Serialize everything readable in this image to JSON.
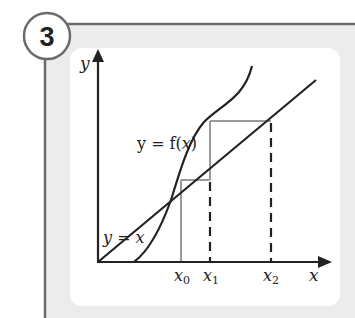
{
  "figure": {
    "number": "3",
    "colors": {
      "frame": "#6b6b6b",
      "band": "#ececec",
      "panel": "#ffffff",
      "axis": "#222222",
      "curve": "#222222",
      "cobweb": "#9a9a9a",
      "dashed": "#222222"
    }
  },
  "axes": {
    "y_label": "y",
    "x_label": "x"
  },
  "curves": {
    "function_label_prefix": "y = f(",
    "function_label_var": "x",
    "function_label_suffix": ")",
    "line_label": "y = x"
  },
  "points": {
    "x0": {
      "base": "x",
      "sub": "0"
    },
    "x1": {
      "base": "x",
      "sub": "1"
    },
    "x2": {
      "base": "x",
      "sub": "2"
    }
  }
}
